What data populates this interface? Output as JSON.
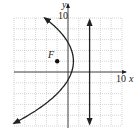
{
  "graph": {
    "axes": {
      "x_label": "x",
      "y_label": "y",
      "x_tick_label": "10",
      "y_tick_label": "10",
      "x_range": [
        -10,
        10
      ],
      "y_range": [
        -10,
        10
      ],
      "grid_step": 2
    },
    "focus": {
      "label": "F",
      "x": -2,
      "y": 2
    },
    "directrix": {
      "x": 4
    },
    "parabola": {
      "equation": "(y-2)^2 = -12(x-1)",
      "vertex": [
        1,
        2
      ],
      "opens": "left"
    },
    "colors": {
      "curve": "#222222",
      "grid": "#b8b8b8",
      "axis": "#333333"
    }
  }
}
